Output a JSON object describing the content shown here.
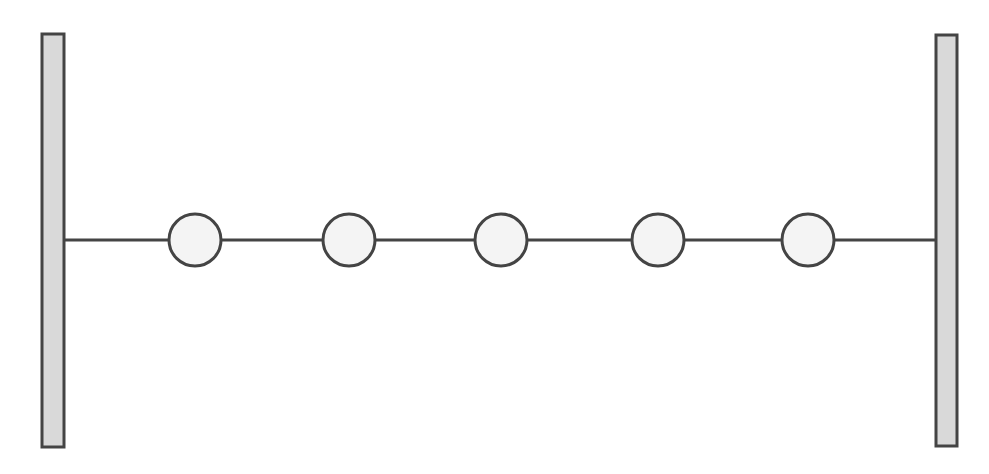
{
  "diagram": {
    "title": "",
    "canvas": {
      "width": 989,
      "height": 474
    },
    "colors": {
      "background": "#ffffff",
      "stroke": "#444444",
      "wall_fill": "#d9d9d9",
      "mass_fill": "#f4f4f4"
    },
    "walls": [
      {
        "id": "left-wall",
        "x": 42,
        "y": 34,
        "width": 22,
        "height": 413
      },
      {
        "id": "right-wall",
        "x": 936,
        "y": 35,
        "width": 21,
        "height": 411
      }
    ],
    "string": {
      "y": 240,
      "x_start": 64,
      "x_end": 936,
      "stroke_width": 3
    },
    "masses": [
      {
        "id": "mass-1",
        "cx": 195,
        "cy": 240,
        "r": 26
      },
      {
        "id": "mass-2",
        "cx": 349,
        "cy": 240,
        "r": 26
      },
      {
        "id": "mass-3",
        "cx": 501,
        "cy": 240,
        "r": 26
      },
      {
        "id": "mass-4",
        "cx": 658,
        "cy": 240,
        "r": 26
      },
      {
        "id": "mass-5",
        "cx": 808,
        "cy": 240,
        "r": 26
      }
    ],
    "mass_count": 5
  }
}
